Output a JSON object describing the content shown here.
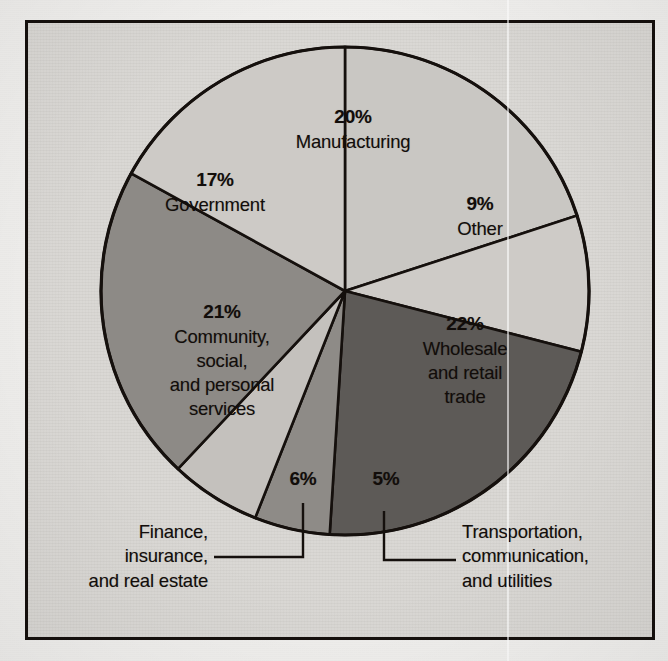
{
  "figure": {
    "frame_border_color": "#15100d",
    "plate_background": "#d9d7d3",
    "page_background": "#efeeec"
  },
  "chart_data": {
    "type": "pie",
    "title": "",
    "subtitle": "",
    "xlabel": "",
    "ylabel": "",
    "legend_position": "none",
    "grid": false,
    "units": "percent",
    "total": 100,
    "start_angle_deg": 0,
    "direction": "clockwise",
    "center": {
      "x": 345,
      "y": 291,
      "radius": 244
    },
    "categories": [
      "Manufacturing",
      "Other",
      "Wholesale and retail trade",
      "Transportation, communication, and utilities",
      "Finance, insurance, and real estate",
      "Community, social, and personal services",
      "Government"
    ],
    "values": [
      20,
      9,
      22,
      5,
      6,
      21,
      17
    ],
    "slices": [
      {
        "key": "manufacturing",
        "percent_label": "20%",
        "value": 20,
        "name_lines": [
          "Manufacturing"
        ],
        "fill": "#c9c7c3",
        "stroke": "#15100d",
        "label_placement": "inside",
        "start_deg": 0,
        "end_deg": 72
      },
      {
        "key": "other",
        "percent_label": "9%",
        "value": 9,
        "name_lines": [
          "Other"
        ],
        "fill": "#cecbc7",
        "stroke": "#15100d",
        "label_placement": "inside",
        "start_deg": 72,
        "end_deg": 104.4
      },
      {
        "key": "wholesale-and-retail-trade",
        "percent_label": "22%",
        "value": 22,
        "name_lines": [
          "Wholesale",
          "and retail",
          "trade"
        ],
        "fill": "#5d5a57",
        "stroke": "#15100d",
        "label_placement": "inside",
        "start_deg": 104.4,
        "end_deg": 183.6
      },
      {
        "key": "transportation-communication-and-utilities",
        "percent_label": "5%",
        "value": 5,
        "name_lines": [
          "Transportation,",
          "communication,",
          "and utilities"
        ],
        "fill": "#8e8b87",
        "stroke": "#15100d",
        "label_placement": "callout-right",
        "start_deg": 183.6,
        "end_deg": 201.6
      },
      {
        "key": "finance-insurance-and-real-estate",
        "percent_label": "6%",
        "value": 6,
        "name_lines": [
          "Finance,",
          "insurance,",
          "and real estate"
        ],
        "fill": "#c4c1bd",
        "stroke": "#15100d",
        "label_placement": "callout-left",
        "start_deg": 201.6,
        "end_deg": 223.2
      },
      {
        "key": "community-social-and-personal-services",
        "percent_label": "21%",
        "value": 21,
        "name_lines": [
          "Community,",
          "social,",
          "and personal",
          "services"
        ],
        "fill": "#8d8a86",
        "stroke": "#15100d",
        "label_placement": "inside",
        "start_deg": 223.2,
        "end_deg": 298.8
      },
      {
        "key": "government",
        "percent_label": "17%",
        "value": 17,
        "name_lines": [
          "Government"
        ],
        "fill": "#cdcac6",
        "stroke": "#15100d",
        "label_placement": "inside",
        "start_deg": 298.8,
        "end_deg": 360
      }
    ]
  },
  "inside_labels": {
    "manufacturing": {
      "pct": "20%",
      "name": "Manufacturing"
    },
    "other": {
      "pct": "9%",
      "name": "Other"
    },
    "government": {
      "pct": "17%",
      "name": "Government"
    },
    "community": {
      "pct": "21%",
      "line1": "Community,",
      "line2": "social,",
      "line3": "and personal",
      "line4": "services"
    },
    "wholesale": {
      "pct": "22%",
      "line1": "Wholesale",
      "line2": "and retail",
      "line3": "trade"
    },
    "finance": {
      "pct": "6%"
    },
    "transportation": {
      "pct": "5%"
    }
  },
  "callouts": {
    "finance": {
      "line1": "Finance,",
      "line2": "insurance,",
      "line3": "and real estate"
    },
    "transportation": {
      "line1": "Transportation,",
      "line2": "communication,",
      "line3": "and utilities"
    }
  }
}
